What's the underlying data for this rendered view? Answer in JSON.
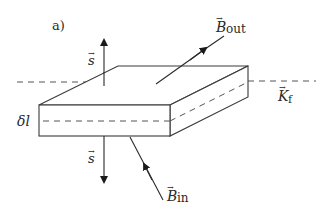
{
  "figure": {
    "panel_label": "a)",
    "labels": {
      "s_top": "s",
      "s_bottom": "s",
      "b_out_base": "B",
      "b_out_sub": "out",
      "b_in_base": "B",
      "b_in_sub": "in",
      "k_base": "K",
      "k_sub": "f",
      "delta_l": "δl"
    },
    "vector_mark": "→"
  }
}
